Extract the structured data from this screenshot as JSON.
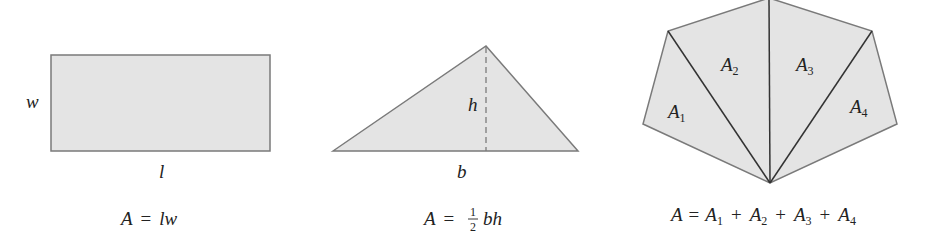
{
  "colors": {
    "fill": "#e4e4e4",
    "stroke": "#7a7a7a",
    "inner_stroke": "#333333",
    "text": "#222222"
  },
  "rectangle": {
    "width_label": "w",
    "length_label": "l",
    "formula": {
      "lhs": "A",
      "eq": "=",
      "rhs": "lw"
    }
  },
  "triangle": {
    "height_label": "h",
    "base_label": "b",
    "formula": {
      "lhs": "A",
      "eq": "=",
      "frac_num": "1",
      "frac_den": "2",
      "rhs": "bh"
    }
  },
  "polygon": {
    "regions": [
      {
        "base": "A",
        "sub": "1"
      },
      {
        "base": "A",
        "sub": "2"
      },
      {
        "base": "A",
        "sub": "3"
      },
      {
        "base": "A",
        "sub": "4"
      }
    ],
    "formula": {
      "lhs": "A",
      "eq": "=",
      "terms": [
        {
          "base": "A",
          "sub": "1"
        },
        {
          "base": "A",
          "sub": "2"
        },
        {
          "base": "A",
          "sub": "3"
        },
        {
          "base": "A",
          "sub": "4"
        }
      ],
      "plus": "+"
    }
  }
}
